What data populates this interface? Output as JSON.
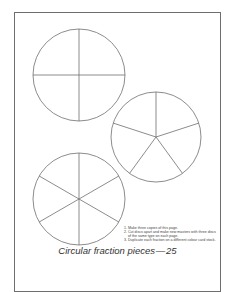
{
  "page": {
    "title": "Circular fraction pieces — 25",
    "line_color": "#6e6e6e"
  },
  "discs": [
    {
      "name": "quarters",
      "divisions": 4,
      "cx": 79,
      "cy": 75,
      "r": 46
    },
    {
      "name": "fifths",
      "divisions": 5,
      "cx": 156,
      "cy": 137,
      "r": 45
    },
    {
      "name": "sixths",
      "divisions": 6,
      "cx": 79,
      "cy": 199,
      "r": 46
    }
  ],
  "instructions": [
    {
      "num": "1.",
      "text": "Make three copies of this page."
    },
    {
      "num": "2.",
      "text": "Cut discs apart and make new masters with three discs of the same type on each page."
    },
    {
      "num": "3.",
      "text": "Duplicate each fraction on a different colour card stock."
    }
  ]
}
